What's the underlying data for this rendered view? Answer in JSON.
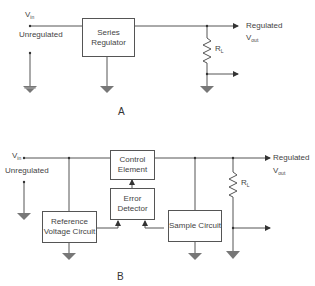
{
  "diagram_a": {
    "caption": "A",
    "input_label": "V",
    "input_sub": "in",
    "input_desc": "Unregulated",
    "block": "Series Regulator",
    "output_label": "Regulated",
    "vout_label": "V",
    "vout_sub": "out",
    "load_label": "R",
    "load_sub": "L"
  },
  "diagram_b": {
    "caption": "B",
    "input_label": "V",
    "input_sub": "in",
    "input_desc": "Unregulated",
    "blocks": {
      "control": "Control Element",
      "error": "Error Detector",
      "reference": "Reference Voltage Circuit",
      "sample": "Sample Circuit"
    },
    "output_label": "Regulated",
    "vout_label": "V",
    "vout_sub": "out",
    "load_label": "R",
    "load_sub": "L"
  }
}
